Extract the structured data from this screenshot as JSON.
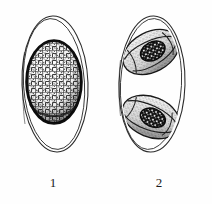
{
  "plate": {
    "kind": "scientific-line-illustration",
    "subject": "coccidian oocysts",
    "background_color": "#fefefe",
    "ink_color": "#1a1a1a",
    "stipple_color": "#2b2b2b",
    "width_px": 212,
    "height_px": 204
  },
  "figures": [
    {
      "label": "1",
      "name": "unsporulated-oocyst",
      "shell": {
        "name": "oocyst-wall",
        "shape": "ellipse",
        "wall_layers": 2,
        "center_x": 55,
        "center_y": 84,
        "radius_x": 33,
        "radius_y": 76
      },
      "contents": [
        {
          "name": "sporont",
          "shape": "ellipse",
          "texture": "coarse-reticulate-granular",
          "center_x": 54,
          "center_y": 82,
          "radius_x": 28,
          "radius_y": 42,
          "outline": "heavy"
        }
      ]
    },
    {
      "label": "2",
      "name": "sporulated-oocyst",
      "shell": {
        "name": "oocyst-wall",
        "shape": "ellipse",
        "wall_layers": 2,
        "center_x": 45,
        "center_y": 84,
        "radius_x": 33,
        "radius_y": 76
      },
      "contents": [
        {
          "name": "sporocyst-upper",
          "shape": "ellipse",
          "texture": "fine-stipple",
          "center_x": 45,
          "center_y": 50,
          "radius_x": 30,
          "radius_y": 20,
          "rotation_deg": -28,
          "inner_mass": {
            "name": "sporozoite-mass",
            "texture": "dense-cellular-stipple",
            "radius_x": 13,
            "radius_y": 9,
            "rotation_deg": -28
          }
        },
        {
          "name": "sporocyst-lower",
          "shape": "ellipse",
          "texture": "fine-stipple",
          "center_x": 45,
          "center_y": 115,
          "radius_x": 30,
          "radius_y": 20,
          "rotation_deg": 22,
          "inner_mass": {
            "name": "sporozoite-mass",
            "texture": "dense-cellular-stipple",
            "radius_x": 13,
            "radius_y": 9,
            "rotation_deg": 22
          }
        }
      ]
    }
  ]
}
